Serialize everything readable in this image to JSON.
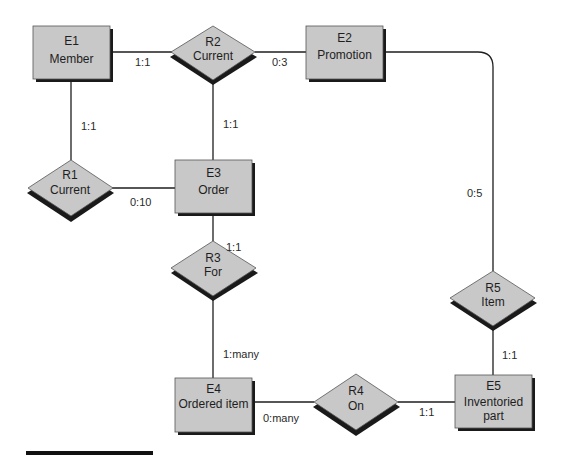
{
  "diagram": {
    "type": "entity-relationship",
    "colors": {
      "fill": "#c8c8c8",
      "shadow": "#1a1a1a",
      "line": "#1e1e1e",
      "background": "#ffffff"
    },
    "entities": [
      {
        "id": "E1",
        "name": "Member"
      },
      {
        "id": "E2",
        "name": "Promotion"
      },
      {
        "id": "E3",
        "name": "Order"
      },
      {
        "id": "E4",
        "name": "Ordered item"
      },
      {
        "id": "E5",
        "name_line1": "Inventoried",
        "name_line2": "part"
      }
    ],
    "relationships": [
      {
        "id": "R1",
        "name": "Current"
      },
      {
        "id": "R2",
        "name": "Current"
      },
      {
        "id": "R3",
        "name": "For"
      },
      {
        "id": "R4",
        "name": "On"
      },
      {
        "id": "R5",
        "name": "Item"
      }
    ],
    "cardinalities": {
      "e1_r2": "1:1",
      "r2_e2": "0:3",
      "e1_r1": "1:1",
      "r2_e3": "1:1",
      "r1_e3": "0:10",
      "e2_r5": "0:5",
      "e3_r3": "1:1",
      "r3_e4": "1:many",
      "r5_e5": "1:1",
      "e4_r4": "0:many",
      "r4_e5": "1:1"
    }
  }
}
